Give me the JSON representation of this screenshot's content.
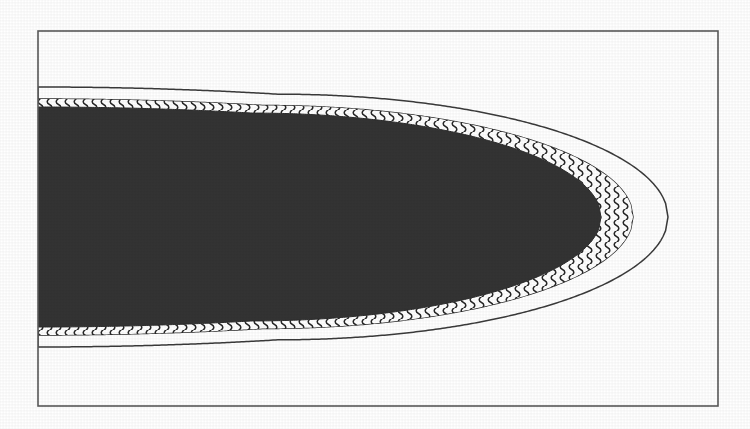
{
  "figure": {
    "domain": "scientific-illustration",
    "caption": "",
    "title": "",
    "background_color": "#ffffff",
    "frame": {
      "name": "figure-border",
      "x": 38,
      "y": 31,
      "width": 680,
      "height": 375,
      "stroke_color": "#595959",
      "stroke_width": 1.6,
      "fill": "#ffffff"
    },
    "layers": [
      {
        "id": "core",
        "label": "dark-core",
        "description": "solid dark parabolic core region",
        "fill_color": "#333333",
        "stroke_color": "#2b2b2b",
        "stroke_width": 1.0,
        "half_height": 110,
        "nose_x": 601,
        "left_x": 38,
        "axis_y": 217
      },
      {
        "id": "wavy-band",
        "label": "wavy-hatched-band",
        "description": "annular band filled with vertical squiggle / serpentine hatching",
        "fill_color": "#ffffff",
        "pattern_color": "#262626",
        "stroke_color": "#2b2b2b",
        "stroke_width": 1.4,
        "half_height": 118,
        "nose_x": 633,
        "left_x": 38,
        "axis_y": 217
      },
      {
        "id": "white-gap",
        "label": "white-gap-band",
        "description": "blank white annular gap between hatched band and outer contour",
        "fill_color": "#ffffff",
        "stroke_color": "#3a3a3a",
        "stroke_width": 1.5,
        "half_height": 130,
        "nose_x": 668,
        "left_x": 38,
        "axis_y": 217
      }
    ],
    "geometry": {
      "axis_y": 217,
      "origin_x": 38,
      "dark_band_top_y": 108,
      "dark_band_bottom_y": 327,
      "dark_nose_tip_x": 601,
      "hatched_nose_tip_x": 633,
      "outer_contour_tip_x": 668,
      "divergence_x": 320
    },
    "hatch": {
      "name": "serpentine-wave-hatch",
      "wave_amplitude": 3.1,
      "wave_period": 11,
      "column_spacing": 9,
      "line_width": 1.5,
      "color": "#262626"
    },
    "colors": {
      "paper": "#ffffff",
      "ink_dark": "#333333",
      "ink_line": "#3a3a3a",
      "frame": "#595959"
    }
  }
}
